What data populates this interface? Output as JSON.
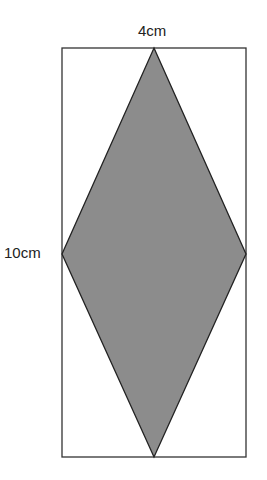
{
  "diagram": {
    "type": "rhombus-in-rectangle",
    "labels": {
      "width": "4cm",
      "height": "10cm"
    },
    "colors": {
      "fill": "#8c8c8c",
      "stroke": "#222222",
      "background": "#ffffff"
    }
  }
}
